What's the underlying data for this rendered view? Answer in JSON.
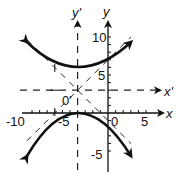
{
  "figure": {
    "type": "hyperbola-graph",
    "equation": "(y-3)^2/9 - (x+4)^2/9 = 1",
    "center": [
      -4,
      3
    ],
    "a": 3,
    "b": 3,
    "asymptote_slopes": [
      1,
      -1
    ],
    "axes": {
      "x_label": "x",
      "y_label": "y",
      "x_prime_label": "x'",
      "y_prime_label": "y'",
      "origin_prime_label": "0'",
      "x_ticks": [
        "-10",
        "-5",
        "0",
        "5"
      ],
      "y_ticks": [
        "10",
        "5",
        "-5"
      ],
      "x_range": [
        -11,
        6
      ],
      "y_range": [
        -7,
        12
      ]
    },
    "colors": {
      "curve": "#111111",
      "axes": "#111111",
      "dashed": "#222222",
      "background": "#ffffff"
    }
  },
  "labels": {
    "y": "y",
    "y_prime": "y'",
    "x": "x",
    "x_prime": "x'",
    "o_prime": "0'",
    "tick_10": "10",
    "tick_5": "5",
    "tick_neg5_y": "-5",
    "tick_neg10_x": "-10",
    "tick_neg5_x": "-5",
    "tick_0_x": "0",
    "tick_5_x": "5"
  }
}
